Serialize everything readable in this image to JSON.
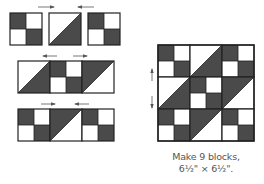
{
  "diagram": {
    "type": "quilt-block-assembly",
    "colors": {
      "dark": "#4a4a4a",
      "light": "#ffffff",
      "outline": "#222222",
      "arrow": "#555555",
      "caption": "#555555"
    },
    "unit_types": {
      "four_patch": "four-patch: dark top-left and bottom-right",
      "hst_dark_br": "half-square triangle: dark lower-right",
      "hst_dark_tl": "half-square triangle: dark upper-left"
    },
    "assembly_rows": [
      {
        "units": [
          "four_patch",
          "hst_dark_br",
          "four_patch"
        ],
        "press_arrows": [
          "right",
          "left"
        ]
      },
      {
        "units": [
          "hst_dark_br",
          "four_patch",
          "hst_dark_tl"
        ],
        "press_arrows": [
          "left",
          "right"
        ]
      },
      {
        "units": [
          "four_patch",
          "hst_dark_tl",
          "four_patch"
        ],
        "press_arrows": [
          "right",
          "left"
        ]
      }
    ],
    "finished_block": {
      "rows": [
        [
          "four_patch",
          "hst_dark_br",
          "four_patch"
        ],
        [
          "hst_dark_br",
          "four_patch",
          "hst_dark_tl"
        ],
        [
          "four_patch",
          "hst_dark_tl",
          "four_patch"
        ]
      ],
      "seam_press_arrows": [
        "up",
        "down"
      ]
    }
  },
  "caption": {
    "line1": "Make 9 blocks,",
    "line2": "6½\" × 6½\"."
  }
}
